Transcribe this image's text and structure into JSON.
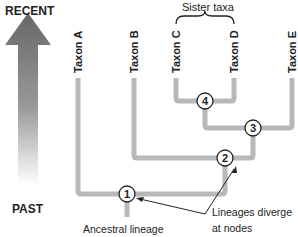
{
  "time_axis": {
    "top_label": "RECENT",
    "bottom_label": "PAST"
  },
  "taxa": [
    {
      "id": "A",
      "label": "Taxon A"
    },
    {
      "id": "B",
      "label": "Taxon B"
    },
    {
      "id": "C",
      "label": "Taxon C"
    },
    {
      "id": "D",
      "label": "Taxon D"
    },
    {
      "id": "E",
      "label": "Taxon E"
    }
  ],
  "nodes": [
    {
      "id": "1",
      "label": "1"
    },
    {
      "id": "2",
      "label": "2"
    },
    {
      "id": "3",
      "label": "3"
    },
    {
      "id": "4",
      "label": "4"
    }
  ],
  "annotations": {
    "sister_taxa": "Sister taxa",
    "ancestral_lineage": "Ancestral lineage",
    "diverge_line1": "Lineages diverge",
    "diverge_line2": "at nodes"
  },
  "colors": {
    "branch": "#b8b8b8",
    "branch_edge": "#9a9a9a",
    "arrow_dark": "#555555",
    "text": "#222222"
  }
}
